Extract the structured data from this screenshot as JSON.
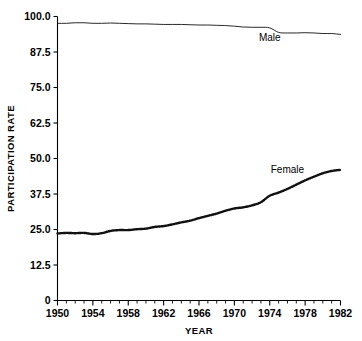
{
  "chart_data": {
    "type": "line",
    "title": "",
    "xlabel": "YEAR",
    "ylabel": "PARTICIPATION RATE",
    "xlim": [
      1950,
      1982
    ],
    "ylim": [
      0,
      100
    ],
    "grid": false,
    "legend": "inline-annotations",
    "x_ticks": [
      "1950",
      "1954",
      "1958",
      "1962",
      "1966",
      "1970",
      "1974",
      "1978",
      "1982"
    ],
    "x_tick_values": [
      1950,
      1954,
      1958,
      1962,
      1966,
      1970,
      1974,
      1978,
      1982
    ],
    "x_minor_tick_interval": 1,
    "y_ticks": [
      "0",
      "12.5",
      "25.0",
      "37.5",
      "50.0",
      "62.5",
      "75.0",
      "87.5",
      "100.0"
    ],
    "y_tick_values": [
      0,
      12.5,
      25,
      37.5,
      50,
      62.5,
      75,
      87.5,
      100
    ],
    "x": [
      1950,
      1951,
      1952,
      1953,
      1954,
      1955,
      1956,
      1957,
      1958,
      1959,
      1960,
      1961,
      1962,
      1963,
      1964,
      1965,
      1966,
      1967,
      1968,
      1969,
      1970,
      1971,
      1972,
      1973,
      1974,
      1975,
      1976,
      1977,
      1978,
      1979,
      1980,
      1981,
      1982
    ],
    "series": [
      {
        "name": "Male",
        "style": "thin-solid-line",
        "values": [
          97.6,
          97.6,
          97.8,
          97.8,
          97.6,
          97.6,
          97.7,
          97.6,
          97.5,
          97.4,
          97.4,
          97.3,
          97.2,
          97.2,
          97.2,
          97.1,
          97.0,
          97.0,
          96.9,
          96.8,
          96.6,
          96.3,
          96.2,
          96.2,
          96.0,
          94.4,
          94.2,
          94.2,
          94.3,
          94.2,
          94.0,
          94.0,
          93.7
        ]
      },
      {
        "name": "Female",
        "style": "dotted-marker-line",
        "values": [
          23.6,
          23.8,
          23.7,
          23.8,
          23.4,
          23.7,
          24.5,
          24.8,
          24.8,
          25.1,
          25.3,
          25.9,
          26.2,
          26.8,
          27.5,
          28.1,
          29.0,
          29.8,
          30.6,
          31.6,
          32.4,
          32.8,
          33.5,
          34.6,
          36.9,
          38.0,
          39.3,
          40.8,
          42.3,
          43.6,
          44.8,
          45.6,
          46.0
        ]
      }
    ],
    "annotations": [
      {
        "text": "Male",
        "x": 1974,
        "y": 91.5
      },
      {
        "text": "Female",
        "x": 1976,
        "y": 45.0
      }
    ]
  }
}
